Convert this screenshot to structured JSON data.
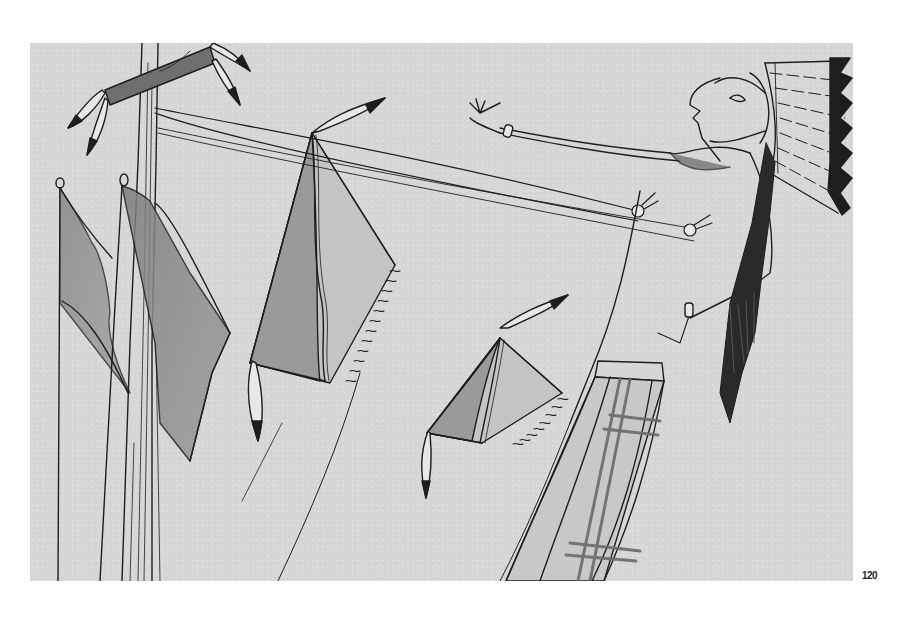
{
  "page": {
    "number": "120",
    "background": "#ffffff"
  },
  "artwork": {
    "description": "Pencil drawing of a figure in a feathered headdress attached by cords to a pole, with flags and shields hanging on the pole",
    "paper_color": "#d6d6d4",
    "ink_color": "#1e1e1e",
    "shade_color": "#8a8a88",
    "elements": [
      "pole-with-crossbar",
      "feather-pendants",
      "flags",
      "shield-left",
      "shield-right",
      "figure-with-headdress",
      "tether-cords",
      "breechcloth",
      "long-hair"
    ]
  }
}
